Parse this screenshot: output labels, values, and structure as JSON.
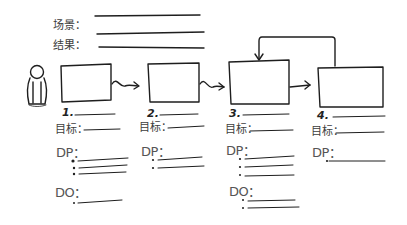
{
  "header": {
    "scene_label": "场景：",
    "result_label": "结果："
  },
  "steps": [
    {
      "number": "1.",
      "goal_label": "目标：",
      "dp_label": "DP：",
      "do_label": "DO："
    },
    {
      "number": "2.",
      "goal_label": "目标：",
      "dp_label": "DP："
    },
    {
      "number": "3.",
      "goal_label": "目标：",
      "dp_label": "DP：",
      "do_label": "DO："
    },
    {
      "number": "4.",
      "goal_label": "目标：",
      "dp_label": "DP："
    }
  ],
  "colors": {
    "ink": "#1e1e1e",
    "text": "#3d3d3d",
    "background": "#ffffff"
  }
}
